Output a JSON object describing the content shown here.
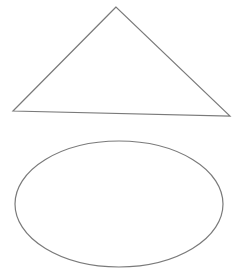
{
  "diagram": {
    "stroke_color": "#7a7a7a",
    "background_color": "#ffffff",
    "shapes": [
      {
        "kind": "triangle",
        "label": ""
      },
      {
        "kind": "ellipse",
        "label": ""
      }
    ]
  }
}
